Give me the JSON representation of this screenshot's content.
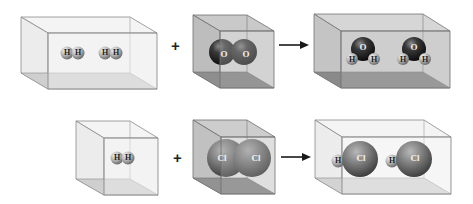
{
  "diagram": {
    "reactions": [
      {
        "id": "water-formation",
        "reactants": [
          {
            "box": "wide",
            "molecules": [
              {
                "formula": "H2",
                "atoms": [
                  "H",
                  "H"
                ]
              },
              {
                "formula": "H2",
                "atoms": [
                  "H",
                  "H"
                ]
              }
            ]
          },
          {
            "box": "cube",
            "molecules": [
              {
                "formula": "O2",
                "atoms": [
                  "O",
                  "O"
                ]
              }
            ]
          }
        ],
        "operator": "+",
        "arrow": "→",
        "products": [
          {
            "box": "wide",
            "molecules": [
              {
                "formula": "H2O",
                "atoms": [
                  "O",
                  "H",
                  "H"
                ]
              },
              {
                "formula": "H2O",
                "atoms": [
                  "O",
                  "H",
                  "H"
                ]
              }
            ]
          }
        ]
      },
      {
        "id": "hydrogen-chloride-formation",
        "reactants": [
          {
            "box": "cube",
            "molecules": [
              {
                "formula": "H2",
                "atoms": [
                  "H",
                  "H"
                ]
              }
            ]
          },
          {
            "box": "cube",
            "molecules": [
              {
                "formula": "Cl2",
                "atoms": [
                  "Cl",
                  "Cl"
                ]
              }
            ]
          }
        ],
        "operator": "+",
        "arrow": "→",
        "products": [
          {
            "box": "wide",
            "molecules": [
              {
                "formula": "HCl",
                "atoms": [
                  "H",
                  "Cl"
                ]
              },
              {
                "formula": "HCl",
                "atoms": [
                  "H",
                  "Cl"
                ]
              }
            ]
          }
        ]
      }
    ],
    "labels": {
      "plus": "+",
      "H": "H",
      "O": "O",
      "Cl": "Cl"
    },
    "colors": {
      "hydrogen": "#a9a9a9",
      "oxygen": "#2a2a2a",
      "chlorine": "#7a7a7a",
      "box_edge": "#7d7d7d",
      "box_fill_light": "#eeeeee",
      "box_fill_dark": "#9a9a9a",
      "arrow": "#1a1a1a"
    }
  }
}
